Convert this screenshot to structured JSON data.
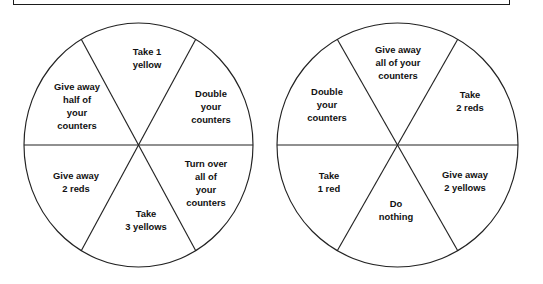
{
  "page": {
    "background_color": "#ffffff",
    "ink_color": "#222222"
  },
  "header_box": {
    "name": "instruction-box",
    "border_color": "#1b1b1b",
    "text": ""
  },
  "spinners": [
    {
      "name": "spinner-left",
      "center": {
        "x": 138.5,
        "y": 145
      },
      "radius_x": 114.5,
      "radius_y": 121,
      "segments": [
        {
          "position": "top",
          "label": "Take 1\nyellow",
          "lines": [
            "Take 1",
            "yellow"
          ]
        },
        {
          "position": "upper-right",
          "label": "Double\nyour\ncounters",
          "lines": [
            "Double",
            "your",
            "counters"
          ]
        },
        {
          "position": "lower-right",
          "label": "Turn over\nall of\nyour\ncounters",
          "lines": [
            "Turn over",
            "all of",
            "your",
            "counters"
          ]
        },
        {
          "position": "bottom",
          "label": "Take\n3 yellows",
          "lines": [
            "Take",
            "3 yellows"
          ]
        },
        {
          "position": "lower-left",
          "label": "Give away\n2 reds",
          "lines": [
            "Give away",
            "2 reds"
          ]
        },
        {
          "position": "upper-left",
          "label": "Give away\nhalf of\nyour\ncounters",
          "lines": [
            "Give away",
            "half of",
            "your",
            "counters"
          ]
        }
      ]
    },
    {
      "name": "spinner-right",
      "center": {
        "x": 397.5,
        "y": 145
      },
      "radius_x": 120.5,
      "radius_y": 121,
      "segments": [
        {
          "position": "top",
          "label": "Give away\nall of your\ncounters",
          "lines": [
            "Give away",
            "all of your",
            "counters"
          ]
        },
        {
          "position": "upper-right",
          "label": "Take\n2 reds",
          "lines": [
            "Take",
            "2 reds"
          ]
        },
        {
          "position": "lower-right",
          "label": "Give away\n2 yellows",
          "lines": [
            "Give away",
            "2 yellows"
          ]
        },
        {
          "position": "bottom",
          "label": "Do\nnothing",
          "lines": [
            "Do",
            "nothing"
          ]
        },
        {
          "position": "lower-left",
          "label": "Take\n1 red",
          "lines": [
            "Take",
            "1 red"
          ]
        },
        {
          "position": "upper-left",
          "label": "Double\nyour\ncounters",
          "lines": [
            "Double",
            "your",
            "counters"
          ]
        }
      ]
    }
  ]
}
